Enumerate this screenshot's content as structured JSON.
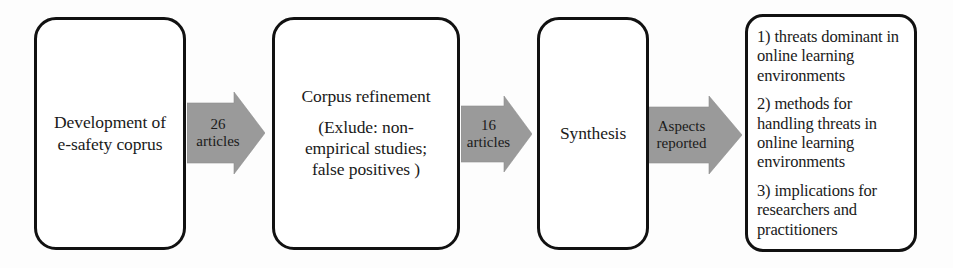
{
  "diagram": {
    "type": "process-flow",
    "background_color": "#fdfdfd",
    "box_border_color": "#111111",
    "arrow_fill_color": "#9a9a9a",
    "text_color": "#1a1a1a",
    "stages": [
      {
        "id": "development",
        "lines": [
          "Development of",
          "e-safety coprus"
        ]
      },
      {
        "id": "corpus-refinement",
        "lines": [
          "Corpus refinement"
        ],
        "detail_lines": [
          "(Exlude: non-",
          "empirical studies;",
          "false positives )"
        ]
      },
      {
        "id": "synthesis",
        "lines": [
          "Synthesis"
        ]
      },
      {
        "id": "outcomes",
        "items": [
          "1) threats dominant in online learning environments",
          "2) methods for handling threats in online learning environments",
          "3) implications for researchers and practitioners"
        ]
      }
    ],
    "connectors": [
      {
        "id": "articles-26",
        "lines": [
          "26",
          "articles"
        ]
      },
      {
        "id": "articles-16",
        "lines": [
          "16",
          "articles"
        ]
      },
      {
        "id": "aspects-reported",
        "lines": [
          "Aspects",
          "reported"
        ]
      }
    ]
  }
}
